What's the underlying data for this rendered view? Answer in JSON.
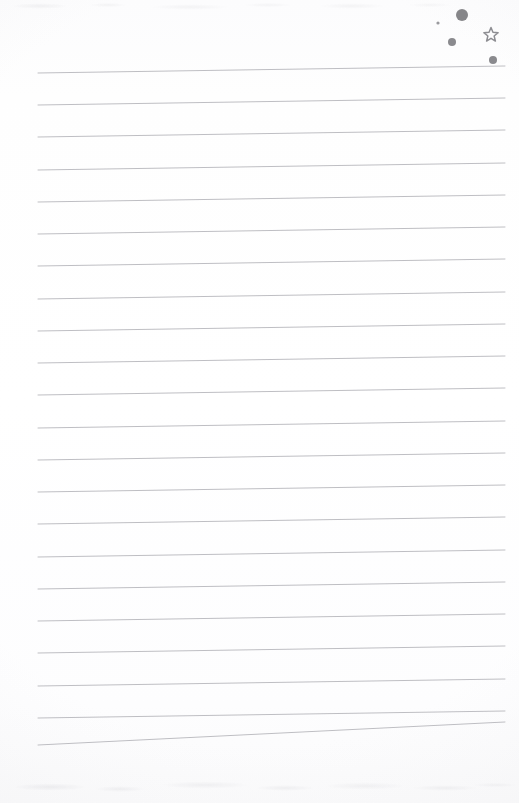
{
  "page": {
    "kind": "lined-notebook-page",
    "width": 519,
    "height": 803,
    "background_color": "#fdfdfd",
    "text_content": "",
    "is_blank": true
  },
  "rules": {
    "count": 21,
    "color": "#b9b9be",
    "thickness": 1,
    "x_start": 38,
    "x_end": 505,
    "first_line_y": 73,
    "spacing": 32.3,
    "tilt_degrees": -2.8,
    "y_positions_left": [
      73,
      105,
      137,
      170,
      202,
      234,
      266,
      299,
      331,
      363,
      395,
      428,
      460,
      492,
      524,
      557,
      589,
      621,
      653,
      686,
      718,
      745
    ],
    "y_positions_right": [
      66,
      98,
      130,
      163,
      195,
      227,
      259,
      292,
      324,
      356,
      388,
      421,
      453,
      485,
      517,
      550,
      582,
      614,
      646,
      679,
      711,
      722
    ]
  },
  "decorations": {
    "label": "doodle-cluster",
    "color": "#8e8e93",
    "items": [
      {
        "name": "dot-large",
        "shape": "circle",
        "cx": 462,
        "cy": 15,
        "r": 6.0,
        "color": "#868689"
      },
      {
        "name": "dot-tiny",
        "shape": "circle",
        "cx": 438,
        "cy": 23,
        "r": 1.6,
        "color": "#9a9a9e"
      },
      {
        "name": "dot-medium",
        "shape": "circle",
        "cx": 452,
        "cy": 42,
        "r": 4.0,
        "color": "#8a8a8e"
      },
      {
        "name": "star-outline",
        "shape": "star",
        "cx": 491,
        "cy": 35,
        "r": 7.5,
        "points": 5,
        "color": "#8e8e93",
        "filled": false
      },
      {
        "name": "dot-small",
        "shape": "circle",
        "cx": 493,
        "cy": 60,
        "r": 4.0,
        "color": "#8a8a8e"
      }
    ]
  }
}
